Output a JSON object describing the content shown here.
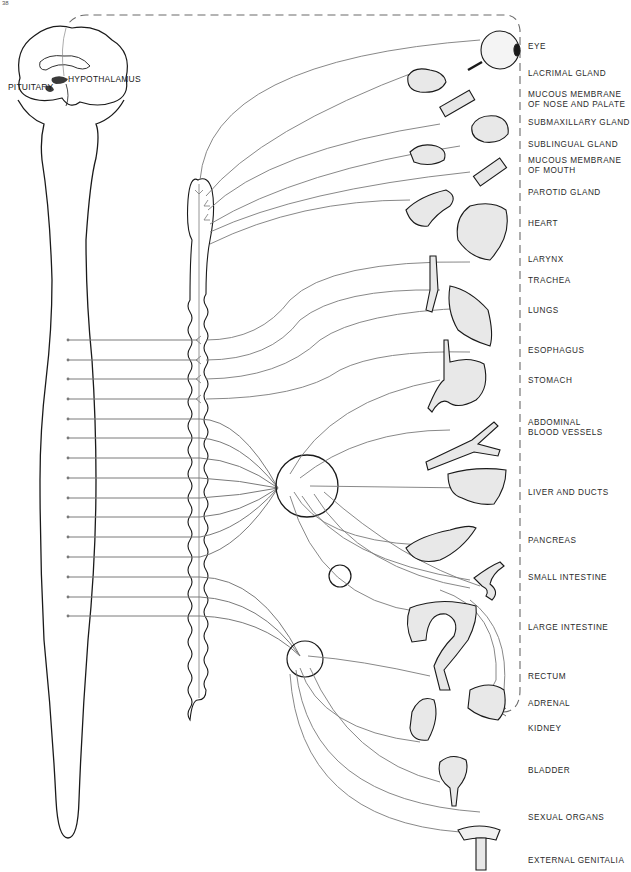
{
  "page": {
    "number": "38"
  },
  "brain": {
    "labels": {
      "hypothalamus": "HYPOTHALAMUS",
      "pituitary": "PITUITARY"
    }
  },
  "organs": [
    {
      "id": "eye",
      "label": "EYE",
      "y": 46
    },
    {
      "id": "lacrimal-gland",
      "label": "LACRIMAL GLAND",
      "y": 72
    },
    {
      "id": "mucous-membrane-nose-palate",
      "label": "MUCOUS MEMBRANE\nOF NOSE AND PALATE",
      "y": 94
    },
    {
      "id": "submaxillary-gland",
      "label": "SUBMAXILLARY GLAND",
      "y": 121
    },
    {
      "id": "sublingual-gland",
      "label": "SUBLINGUAL GLAND",
      "y": 143
    },
    {
      "id": "mucous-membrane-mouth",
      "label": "MUCOUS MEMBRANE\nOF MOUTH",
      "y": 158
    },
    {
      "id": "parotid-gland",
      "label": "PAROTID GLAND",
      "y": 189
    },
    {
      "id": "heart",
      "label": "HEART",
      "y": 220
    },
    {
      "id": "larynx",
      "label": "LARYNX",
      "y": 256
    },
    {
      "id": "trachea",
      "label": "TRACHEA",
      "y": 276
    },
    {
      "id": "lungs",
      "label": "LUNGS",
      "y": 306
    },
    {
      "id": "esophagus",
      "label": "ESOPHAGUS",
      "y": 347
    },
    {
      "id": "stomach",
      "label": "STOMACH",
      "y": 376
    },
    {
      "id": "abdominal-blood-vessels",
      "label": "ABDOMINAL\nBLOOD VESSELS",
      "y": 419
    },
    {
      "id": "liver-and-ducts",
      "label": "LIVER AND DUCTS",
      "y": 488
    },
    {
      "id": "pancreas",
      "label": "PANCREAS",
      "y": 537
    },
    {
      "id": "small-intestine",
      "label": "SMALL INTESTINE",
      "y": 574
    },
    {
      "id": "large-intestine",
      "label": "LARGE INTESTINE",
      "y": 624
    },
    {
      "id": "rectum",
      "label": "RECTUM",
      "y": 672
    },
    {
      "id": "adrenal",
      "label": "ADRENAL",
      "y": 699
    },
    {
      "id": "kidney",
      "label": "KIDNEY",
      "y": 724
    },
    {
      "id": "bladder",
      "label": "BLADDER",
      "y": 766
    },
    {
      "id": "sexual-organs",
      "label": "SEXUAL ORGANS",
      "y": 813
    },
    {
      "id": "external-genitalia",
      "label": "EXTERNAL GENITALIA",
      "y": 857
    }
  ],
  "colors": {
    "outline": "#1a1a1a",
    "nerve": "#7a7a7a",
    "dashed": "#6a6a6a",
    "organ_fill": "#e8e8e8",
    "hypothalamus_fill": "#3a3a3a"
  }
}
